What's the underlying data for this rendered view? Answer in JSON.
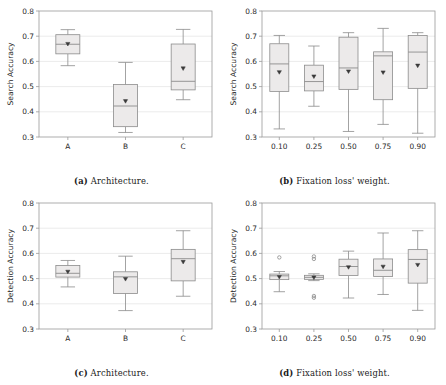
{
  "figure": {
    "panels": [
      {
        "key": "a",
        "caption_label": "(a)",
        "caption_text": "Architecture.",
        "chart_data": {
          "type": "box",
          "title": "",
          "xlabel": "",
          "ylabel": "Search Accuracy",
          "ylim": [
            0.3,
            0.8
          ],
          "yticks": [
            0.3,
            0.4,
            0.5,
            0.6,
            0.7,
            0.8
          ],
          "ytick_labels": [
            "0.3",
            "0.4",
            "0.5",
            "0.6",
            "0.7",
            "0.8"
          ],
          "grid": true,
          "categories": [
            "A",
            "B",
            "C"
          ],
          "boxes": [
            {
              "category": "A",
              "whisker_low": 0.583,
              "q1": 0.63,
              "median": 0.668,
              "q3": 0.706,
              "whisker_high": 0.726,
              "mean": 0.669,
              "outliers": []
            },
            {
              "category": "B",
              "whisker_low": 0.318,
              "q1": 0.341,
              "median": 0.423,
              "q3": 0.508,
              "whisker_high": 0.596,
              "mean": 0.442,
              "outliers": []
            },
            {
              "category": "C",
              "whisker_low": 0.448,
              "q1": 0.487,
              "median": 0.521,
              "q3": 0.669,
              "whisker_high": 0.727,
              "mean": 0.572,
              "outliers": []
            }
          ]
        }
      },
      {
        "key": "b",
        "caption_label": "(b)",
        "caption_text": "Fixation loss' weight.",
        "chart_data": {
          "type": "box",
          "title": "",
          "xlabel": "",
          "ylabel": "Search Accuracy",
          "ylim": [
            0.3,
            0.8
          ],
          "yticks": [
            0.3,
            0.4,
            0.5,
            0.6,
            0.7,
            0.8
          ],
          "ytick_labels": [
            "0.3",
            "0.4",
            "0.5",
            "0.6",
            "0.7",
            "0.8"
          ],
          "grid": true,
          "categories": [
            "0.10",
            "0.25",
            "0.50",
            "0.75",
            "0.90"
          ],
          "boxes": [
            {
              "category": "0.10",
              "whisker_low": 0.332,
              "q1": 0.481,
              "median": 0.59,
              "q3": 0.67,
              "whisker_high": 0.703,
              "mean": 0.557,
              "outliers": []
            },
            {
              "category": "0.25",
              "whisker_low": 0.422,
              "q1": 0.483,
              "median": 0.52,
              "q3": 0.585,
              "whisker_high": 0.661,
              "mean": 0.54,
              "outliers": []
            },
            {
              "category": "0.50",
              "whisker_low": 0.322,
              "q1": 0.489,
              "median": 0.574,
              "q3": 0.696,
              "whisker_high": 0.714,
              "mean": 0.56,
              "outliers": []
            },
            {
              "category": "0.75",
              "whisker_low": 0.35,
              "q1": 0.448,
              "median": 0.622,
              "q3": 0.638,
              "whisker_high": 0.731,
              "mean": 0.556,
              "outliers": []
            },
            {
              "category": "0.90",
              "whisker_low": 0.315,
              "q1": 0.493,
              "median": 0.637,
              "q3": 0.703,
              "whisker_high": 0.714,
              "mean": 0.583,
              "outliers": []
            }
          ]
        }
      },
      {
        "key": "c",
        "caption_label": "(c)",
        "caption_text": "Architecture.",
        "chart_data": {
          "type": "box",
          "title": "",
          "xlabel": "",
          "ylabel": "Detection Accuracy",
          "ylim": [
            0.3,
            0.8
          ],
          "yticks": [
            0.3,
            0.4,
            0.5,
            0.6,
            0.7,
            0.8
          ],
          "ytick_labels": [
            "0.3",
            "0.4",
            "0.5",
            "0.6",
            "0.7",
            "0.8"
          ],
          "grid": true,
          "categories": [
            "A",
            "B",
            "C"
          ],
          "boxes": [
            {
              "category": "A",
              "whisker_low": 0.467,
              "q1": 0.506,
              "median": 0.521,
              "q3": 0.552,
              "whisker_high": 0.572,
              "mean": 0.527,
              "outliers": []
            },
            {
              "category": "B",
              "whisker_low": 0.373,
              "q1": 0.441,
              "median": 0.507,
              "q3": 0.527,
              "whisker_high": 0.589,
              "mean": 0.498,
              "outliers": []
            },
            {
              "category": "C",
              "whisker_low": 0.43,
              "q1": 0.491,
              "median": 0.579,
              "q3": 0.616,
              "whisker_high": 0.69,
              "mean": 0.566,
              "outliers": []
            }
          ]
        }
      },
      {
        "key": "d",
        "caption_label": "(d)",
        "caption_text": "Fixation loss' weight.",
        "chart_data": {
          "type": "box",
          "title": "",
          "xlabel": "",
          "ylabel": "Detection Accuracy",
          "ylim": [
            0.3,
            0.8
          ],
          "yticks": [
            0.3,
            0.4,
            0.5,
            0.6,
            0.7,
            0.8
          ],
          "ytick_labels": [
            "0.3",
            "0.4",
            "0.5",
            "0.6",
            "0.7",
            "0.8"
          ],
          "grid": true,
          "categories": [
            "0.10",
            "0.25",
            "0.50",
            "0.75",
            "0.90"
          ],
          "boxes": [
            {
              "category": "0.10",
              "whisker_low": 0.448,
              "q1": 0.496,
              "median": 0.511,
              "q3": 0.518,
              "whisker_high": 0.528,
              "mean": 0.506,
              "outliers": [
                0.584
              ]
            },
            {
              "category": "0.25",
              "whisker_low": 0.492,
              "q1": 0.497,
              "median": 0.505,
              "q3": 0.513,
              "whisker_high": 0.519,
              "mean": 0.504,
              "outliers": [
                0.588,
                0.578,
                0.431,
                0.424
              ]
            },
            {
              "category": "0.50",
              "whisker_low": 0.423,
              "q1": 0.512,
              "median": 0.548,
              "q3": 0.577,
              "whisker_high": 0.609,
              "mean": 0.545,
              "outliers": []
            },
            {
              "category": "0.75",
              "whisker_low": 0.437,
              "q1": 0.508,
              "median": 0.533,
              "q3": 0.578,
              "whisker_high": 0.681,
              "mean": 0.547,
              "outliers": []
            },
            {
              "category": "0.90",
              "whisker_low": 0.374,
              "q1": 0.482,
              "median": 0.576,
              "q3": 0.615,
              "whisker_high": 0.69,
              "mean": 0.554,
              "outliers": []
            }
          ]
        }
      }
    ],
    "style": {
      "box_fill": "#eceaea",
      "box_edge": "#8c8c8c",
      "whisker_color": "#8c8c8c",
      "median_color": "#8c8c8c",
      "mean_color": "#3a3a3a",
      "grid_color": "#e3e3e3",
      "frame_color": "#9a9a9a",
      "text_color": "#2b2b2b"
    }
  }
}
